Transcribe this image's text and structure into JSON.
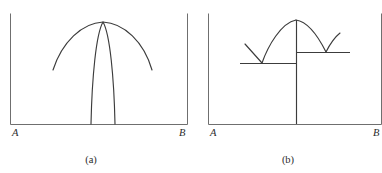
{
  "figure": {
    "background_color": "#ffffff",
    "frame_color": "#6f6f6f",
    "curve_color": "#3c3c3c",
    "label_color": "#2b2b2b",
    "panels": [
      {
        "id": "a",
        "caption": "(a)",
        "left_label": "A",
        "right_label": "B",
        "frame": {
          "x_left": 10,
          "x_right": 188,
          "y_baseline": 124,
          "y_top": 14
        },
        "curves": [
          {
            "name": "wide-shallow-arc",
            "description": "broad low-curvature arc peaking at the common apex",
            "apex": [
              103,
              22
            ],
            "left_end": [
              53,
              70
            ],
            "right_end": [
              152,
              70
            ]
          },
          {
            "name": "narrow-tall-spike",
            "description": "narrow sharply peaked curve descending to the baseline",
            "apex": [
              103,
              22
            ],
            "left_foot": [
              91,
              124
            ],
            "right_foot": [
              115,
              124
            ]
          }
        ]
      },
      {
        "id": "b",
        "caption": "(b)",
        "left_label": "A",
        "right_label": "B",
        "frame": {
          "x_left": 208,
          "x_right": 382,
          "y_baseline": 124,
          "y_top": 14
        },
        "curves": [
          {
            "name": "left-arc",
            "description": "ascending arc from the lower step level to the apex",
            "start": [
              262,
              63
            ],
            "apex": [
              296,
              20
            ]
          },
          {
            "name": "right-arc",
            "description": "descending arc from the apex to the upper step level",
            "apex": [
              296,
              20
            ],
            "end": [
              326,
              52
            ]
          },
          {
            "name": "left-v-arm",
            "description": "straight descending arm meeting the left arc at a V vertex",
            "start": [
              245,
              44
            ],
            "vertex": [
              262,
              63
            ]
          },
          {
            "name": "right-v-arm",
            "description": "straight ascending arm rising from the right V vertex",
            "vertex": [
              326,
              52
            ],
            "end": [
              340,
              33
            ]
          },
          {
            "name": "apex-drop-line",
            "description": "vertical line from the apex down to the baseline",
            "top": [
              296,
              20
            ],
            "bottom": [
              296,
              124
            ]
          }
        ],
        "levels": [
          {
            "name": "lower-step-level",
            "y": 63,
            "x_start": 240,
            "x_end": 296
          },
          {
            "name": "upper-step-level",
            "y": 52,
            "x_start": 296,
            "x_end": 350
          }
        ]
      }
    ]
  }
}
